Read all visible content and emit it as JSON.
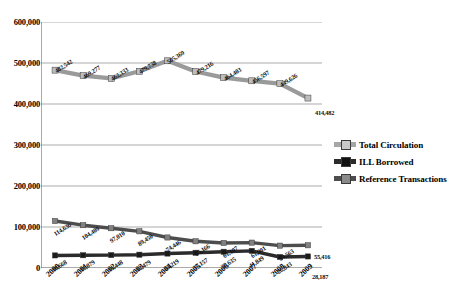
{
  "chart_data": {
    "type": "line",
    "title": "",
    "xlabel": "",
    "ylabel": "",
    "categories": [
      "2000",
      "2001",
      "2002",
      "2003",
      "2004",
      "2005",
      "2006",
      "2007",
      "2008",
      "2009"
    ],
    "ylim": [
      0,
      600000
    ],
    "yticks": [
      "0",
      "100,000",
      "200,000",
      "300,000",
      "400,000",
      "500,000",
      "600,000"
    ],
    "ytick_values": [
      0,
      100000,
      200000,
      300000,
      400000,
      500000,
      600000
    ],
    "grid": true,
    "legend_position": "right",
    "series": [
      {
        "name": "Total Circulation",
        "color": "#9a9a9a",
        "values": [
          482542,
          469277,
          462333,
          479738,
          505369,
          479216,
          464403,
          456597,
          449626,
          414482
        ],
        "labels": [
          "482,542",
          "469,277",
          "462,333",
          "479,738",
          "505,369",
          "479,216",
          "464,403",
          "456,597",
          "449,626",
          "414,482"
        ]
      },
      {
        "name": "ILL Borrowed",
        "color": "#2b2b2b",
        "values": [
          30668,
          31079,
          31448,
          32479,
          35219,
          37157,
          39635,
          41849,
          26843,
          28187
        ],
        "labels": [
          "30,668",
          "31,079",
          "31,448",
          "32,479",
          "35,219",
          "37,157",
          "39,635",
          "41,849",
          "26,843",
          "28,187"
        ]
      },
      {
        "name": "Reference Transactions",
        "color": "#4d4d4d",
        "values": [
          114636,
          104409,
          97010,
          89450,
          74446,
          65166,
          61107,
          61901,
          54563,
          55416
        ],
        "labels": [
          "114,636",
          "104,409",
          "97,010",
          "89,450",
          "74,446",
          "65,166",
          "61,107",
          "61,901",
          "54,563",
          "55,416"
        ]
      }
    ]
  },
  "legend": {
    "items": [
      {
        "label": "Total Circulation"
      },
      {
        "label": "ILL Borrowed"
      },
      {
        "label": "Reference Transactions"
      }
    ]
  }
}
